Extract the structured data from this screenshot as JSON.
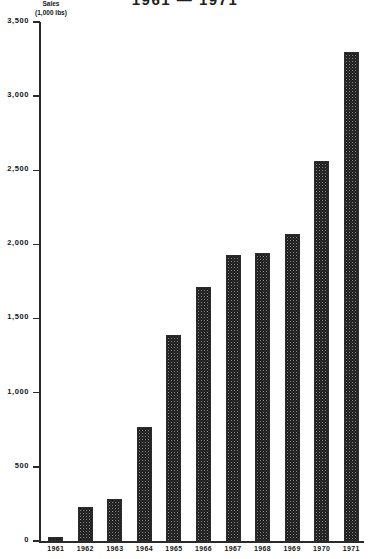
{
  "chart_data": {
    "type": "bar",
    "title": "1961 — 1971",
    "xlabel": "",
    "ylabel": "Sales",
    "ylabel_units": "(1,000 lbs)",
    "categories": [
      "1961",
      "1962",
      "1963",
      "1964",
      "1965",
      "1966",
      "1967",
      "1968",
      "1969",
      "1970",
      "1971"
    ],
    "values": [
      30,
      230,
      280,
      770,
      1390,
      1710,
      1930,
      1940,
      2070,
      2560,
      3300
    ],
    "ylim": [
      0,
      3500
    ],
    "ytick_values": [
      0,
      500,
      1000,
      1500,
      2000,
      2500,
      3000,
      3500
    ],
    "ytick_labels": [
      "0",
      "500",
      "1,000",
      "1,500",
      "2,000",
      "2,500",
      "3,000",
      "3,500"
    ],
    "grid": false,
    "legend": null,
    "bar_fill": "#8f8f8f",
    "bar_edge": "#2b2b2b",
    "axis_color": "#2a2a2a",
    "background": "#ffffff"
  }
}
